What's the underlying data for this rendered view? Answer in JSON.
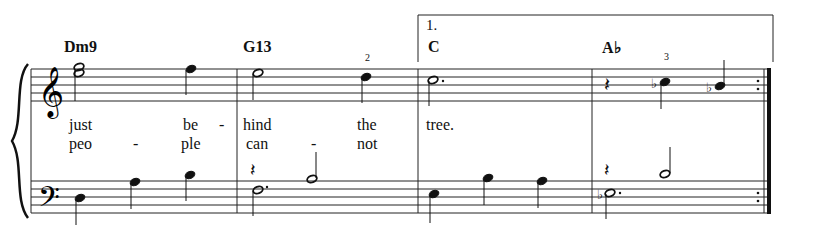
{
  "score": {
    "volta": {
      "label": "1."
    },
    "chords": [
      {
        "symbol": "Dm9",
        "x": 64
      },
      {
        "symbol": "G13",
        "x": 243
      },
      {
        "symbol": "C",
        "x": 428
      },
      {
        "symbol": "A♭",
        "x": 602
      }
    ],
    "fingerings": [
      {
        "value": "2",
        "x": 366,
        "y": 53
      },
      {
        "value": "3",
        "x": 664,
        "y": 52
      }
    ],
    "lyrics": {
      "verse1": [
        {
          "text": "just",
          "x": 69
        },
        {
          "text": "be",
          "x": 183
        },
        {
          "text": "-",
          "x": 219
        },
        {
          "text": "hind",
          "x": 243
        },
        {
          "text": "the",
          "x": 357
        },
        {
          "text": "tree.",
          "x": 426
        }
      ],
      "verse2": [
        {
          "text": "peo",
          "x": 69
        },
        {
          "text": "-",
          "x": 133
        },
        {
          "text": "ple",
          "x": 181
        },
        {
          "text": "can",
          "x": 246
        },
        {
          "text": "-",
          "x": 311
        },
        {
          "text": "not",
          "x": 357
        }
      ]
    },
    "clefs": {
      "treble": "treble-clef",
      "bass": "bass-clef"
    },
    "measures": [
      {
        "number": 1,
        "chord": "Dm9"
      },
      {
        "number": 2,
        "chord": "G13"
      },
      {
        "number": 3,
        "chord": "C",
        "ending": "1."
      },
      {
        "number": 4,
        "chord": "A♭",
        "end_repeat": true
      }
    ]
  }
}
